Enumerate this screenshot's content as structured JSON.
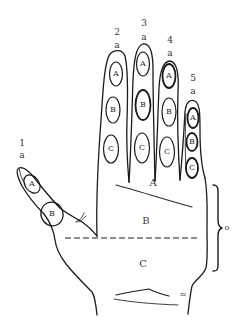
{
  "diagram": {
    "fingers": [
      {
        "number": "1",
        "tip_label": "a",
        "segments": [
          "A",
          "B"
        ]
      },
      {
        "number": "2",
        "tip_label": "a",
        "segments": [
          "A",
          "B",
          "C"
        ]
      },
      {
        "number": "3",
        "tip_label": "a",
        "segments": [
          "A",
          "B",
          "C"
        ]
      },
      {
        "number": "4",
        "tip_label": "a",
        "segments": [
          "A",
          "B",
          "C"
        ]
      },
      {
        "number": "5",
        "tip_label": "a",
        "segments": [
          "A",
          "B",
          "C"
        ]
      }
    ],
    "palm_zones": [
      "A",
      "B",
      "C"
    ],
    "bracket_label": "o",
    "wrist_mark": "≈"
  },
  "colors": {
    "line": "#1c1c1c",
    "text": "#333333",
    "background": "#ffffff"
  }
}
